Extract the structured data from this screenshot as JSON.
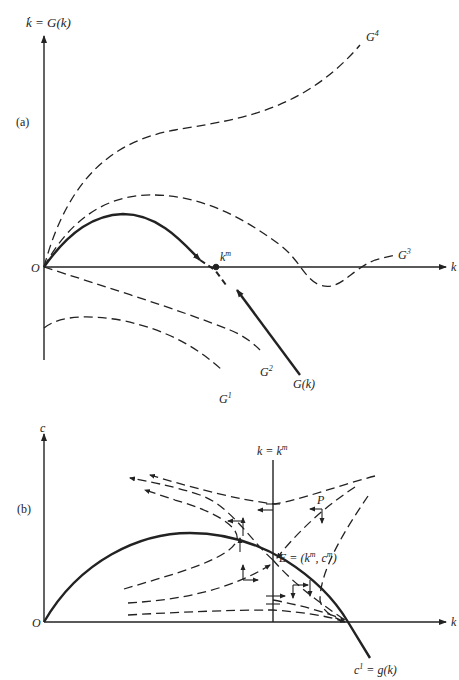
{
  "figure": {
    "panel_a": {
      "tag": "(a)",
      "y_axis_label": "k̇ = G(k)",
      "x_axis_label": "k",
      "origin_label": "O",
      "steady_state_label": "k",
      "steady_state_sup": "m",
      "curves": [
        {
          "name": "G4",
          "base": "G",
          "sup": "4",
          "style": "dashed"
        },
        {
          "name": "G3",
          "base": "G",
          "sup": "3",
          "style": "dashed"
        },
        {
          "name": "G2",
          "base": "G",
          "sup": "2",
          "style": "dashed"
        },
        {
          "name": "G1",
          "base": "G",
          "sup": "1",
          "style": "dashed"
        },
        {
          "name": "G(k)",
          "label": "G(k)",
          "style": "solid"
        }
      ]
    },
    "panel_b": {
      "tag": "(b)",
      "y_axis_label": "c",
      "x_axis_label": "k",
      "origin_label": "O",
      "vertical_line_label": "k = k",
      "vertical_line_sup": "m",
      "equilibrium_label": "E = (k",
      "equilibrium_sup_k": "m",
      "equilibrium_mid": ", c",
      "equilibrium_sup_c": "m",
      "equilibrium_end": ")",
      "point_label": "P",
      "curve_label": "c",
      "curve_sup": "1",
      "curve_label_rest": " = g(k)"
    }
  }
}
